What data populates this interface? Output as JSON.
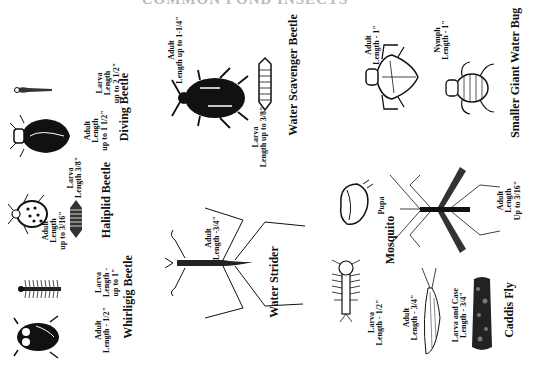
{
  "document": {
    "title": "COMMON POND INSECTS"
  },
  "insects": {
    "whirligig": {
      "name": "Whirligig Beetle",
      "adult_line1": "Adult",
      "adult_line2": "Length - 1/2\"",
      "larva_line1": "Larva",
      "larva_line2": "Length -",
      "larva_line3": "up to 1\""
    },
    "haliplid": {
      "name": "Haliplid Beetle",
      "adult_line1": "Adult",
      "adult_line2": "Length",
      "adult_line3": "up to 3/16\"",
      "larva_line1": "Larva",
      "larva_line2": "Length 3/8\""
    },
    "diving": {
      "name": "Diving Beetle",
      "adult_line1": "Adult",
      "adult_line2": "Length",
      "adult_line3": "up to 1 1/2\"",
      "larva_line1": "Larva",
      "larva_line2": "Length",
      "larva_line3": "up to 2 1/2\""
    },
    "water_strider": {
      "name": "Water Strider",
      "adult_line1": "Adult",
      "adult_line2": "Length -3/4\""
    },
    "water_scavenger": {
      "name": "Water Scavenger Beetle",
      "adult_line1": "Adult",
      "adult_line2": "Length up to 1-1/4\"",
      "larva_line1": "Larva",
      "larva_line2": "Length up to 3/8\""
    },
    "mosquito": {
      "name": "Mosquito",
      "pupa_label": "Pupa",
      "larva_line1": "Larva",
      "larva_line2": "Length - 1/2\"",
      "adult_line1": "Adult",
      "adult_line2": "Length",
      "adult_line3": "Up to 3/16\""
    },
    "caddis": {
      "name": "Caddis Fly",
      "adult_line1": "Adult",
      "adult_line2": "Length - 3/4\"",
      "larva_line1": "Larva and Case",
      "larva_line2": "Length - 3/4\""
    },
    "giant_water_bug": {
      "name": "Smaller Giant Water Bug",
      "adult_line1": "Adult",
      "adult_line2": "Length - 1\"",
      "nymph_line1": "Nymph",
      "nymph_line2": "Length - 1\""
    }
  }
}
